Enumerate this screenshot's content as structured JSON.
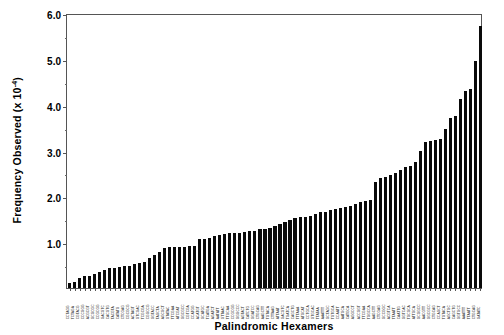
{
  "chart_data": {
    "type": "bar",
    "title": "",
    "xlabel": "Palindromic Hexamers",
    "ylabel": "Frequency Observed (x 10",
    "ylabel_exponent": "-4",
    "ylabel_suffix": ")",
    "ylim": [
      0,
      6.0
    ],
    "ytick_labels": [
      "6.0",
      "5.0",
      "4.0",
      "3.0",
      "2.0",
      "1.0"
    ],
    "ytick_values": [
      6.0,
      5.0,
      4.0,
      3.0,
      2.0,
      1.0
    ],
    "yminor_values": [
      5.5,
      4.5,
      3.5,
      2.5,
      1.5,
      0.5
    ],
    "grid": false,
    "legend": false,
    "bar_color": "#0a0a0a",
    "axis_color": "#555555",
    "categories": [
      "CCTAGG",
      "TCTAGA",
      "CGTACG",
      "CCCGGG",
      "ACGCGT",
      "GCGCGC",
      "CCGCGG",
      "GACGTC",
      "CACGTG",
      "TACGTA",
      "CATATG",
      "CTCGAG",
      "CGCGCG",
      "ACTAGT",
      "GTCGAC",
      "TCGCGA",
      "CGGCCG",
      "GGTACC",
      "TAGCTA",
      "AGCGCT",
      "GTATAC",
      "TTCGAA",
      "ATCGAT",
      "GGCGCC",
      "CGTCGA",
      "CCATGG",
      "ACATGT",
      "GCATGC",
      "TCATGA",
      "AGATCT",
      "AATATT",
      "GTTAAC",
      "TTGCAA",
      "CCGCGG",
      "GGGCCC",
      "AGTACT",
      "CATCTG",
      "GGATCC",
      "CTGCAG",
      "AAGCTT",
      "TGTACA",
      "CTTAAG",
      "ATTAAT",
      "GACGTC",
      "TGATCA",
      "CAGCTG",
      "TTTAAA",
      "ATGCAT",
      "CCTGCA",
      "GTGCAC",
      "TTATAA",
      "AAATTT",
      "GCTAGC",
      "TGTGCA",
      "CCAATT",
      "AATGCA",
      "CATGCA",
      "AGGCCT",
      "ACCGGT",
      "TTCGAA",
      "TGGCCA",
      "AAGCTT",
      "CTCGAG",
      "GCCGGC",
      "ACGTCA",
      "TTAATT",
      "CAATTG",
      "GGTCAC",
      "TGCGCA",
      "ATTGCA",
      "GCGGCC",
      "AACGTT",
      "GGCGCC",
      "CTGCAG",
      "CCAGCT",
      "TGTACA",
      "AGCTGC",
      "CAGCTG",
      "GGTGCC",
      "AAATTT",
      "TTAATT",
      "CTGCAG",
      "GATATC"
    ],
    "values": [
      0.12,
      0.13,
      0.22,
      0.26,
      0.26,
      0.3,
      0.34,
      0.4,
      0.43,
      0.44,
      0.45,
      0.47,
      0.48,
      0.52,
      0.54,
      0.57,
      0.66,
      0.72,
      0.79,
      0.88,
      0.89,
      0.89,
      0.9,
      0.9,
      0.91,
      0.92,
      1.06,
      1.08,
      1.1,
      1.13,
      1.15,
      1.17,
      1.2,
      1.21,
      1.21,
      1.22,
      1.24,
      1.25,
      1.28,
      1.29,
      1.3,
      1.36,
      1.4,
      1.45,
      1.48,
      1.52,
      1.54,
      1.55,
      1.58,
      1.62,
      1.65,
      1.66,
      1.7,
      1.72,
      1.74,
      1.76,
      1.8,
      1.84,
      1.88,
      1.9,
      1.91,
      2.32,
      2.4,
      2.43,
      2.47,
      2.5,
      2.58,
      2.64,
      2.66,
      2.74,
      3.0,
      3.18,
      3.2,
      3.22,
      3.26,
      3.48,
      3.72,
      3.76,
      4.12,
      4.3,
      4.34,
      4.96,
      5.72
    ]
  }
}
